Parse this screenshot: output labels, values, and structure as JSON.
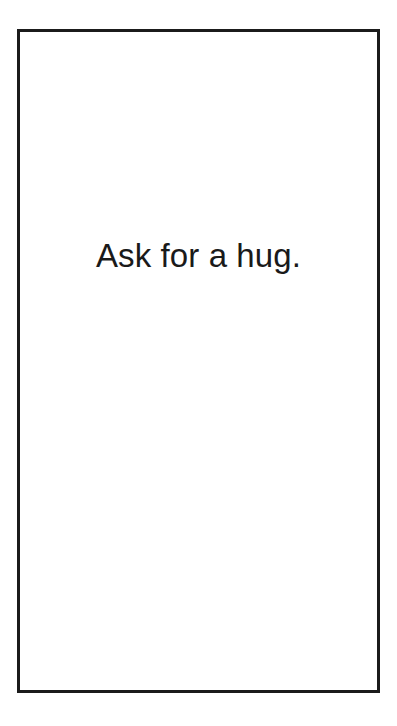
{
  "card": {
    "prompt": "Ask for a hug.",
    "border_color": "#1b1b1b",
    "background_color": "#ffffff",
    "text_color": "#1a1a1a"
  },
  "page": {
    "background_color": "#ffffff"
  }
}
